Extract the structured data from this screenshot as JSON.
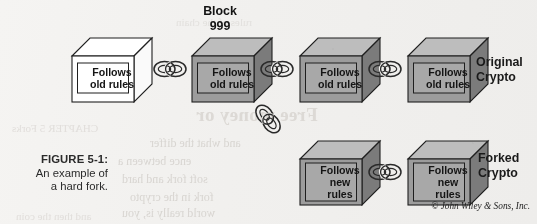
{
  "figure": {
    "caption_label": "FIGURE 5-1:",
    "caption_line1": "An example of",
    "caption_line2": "a hard fork.",
    "credit": "© John Wiley & Sons, Inc.",
    "background_color": "#f2f1ef"
  },
  "diagram": {
    "type": "blockchain-hard-fork",
    "block_marker": {
      "line1": "Block",
      "line2": "999"
    },
    "chain_top": [
      {
        "id": "block-1",
        "line1": "Follows",
        "line2": "old rules",
        "style": "white",
        "face_front": "#ffffff",
        "face_top": "#ffffff",
        "face_side": "#ffffff"
      },
      {
        "id": "block-2",
        "line1": "Follows",
        "line2": "old rules",
        "style": "gray",
        "face_front": "#9c9c9c",
        "face_top": "#bdbdbd",
        "face_side": "#7b7b7b"
      },
      {
        "id": "block-3",
        "line1": "Follows",
        "line2": "old rules",
        "style": "gray",
        "face_front": "#9c9c9c",
        "face_top": "#bdbdbd",
        "face_side": "#7b7b7b"
      },
      {
        "id": "block-4",
        "line1": "Follows",
        "line2": "old rules",
        "style": "gray",
        "face_front": "#9c9c9c",
        "face_top": "#bdbdbd",
        "face_side": "#7b7b7b"
      }
    ],
    "chain_fork": [
      {
        "id": "block-5",
        "line1": "Follows",
        "line2": "new",
        "line3": "rules",
        "style": "gray",
        "face_front": "#9c9c9c",
        "face_top": "#bdbdbd",
        "face_side": "#7b7b7b"
      },
      {
        "id": "block-6",
        "line1": "Follows",
        "line2": "new",
        "line3": "rules",
        "style": "gray",
        "face_front": "#9c9c9c",
        "face_top": "#bdbdbd",
        "face_side": "#7b7b7b"
      }
    ],
    "branch_labels": {
      "original_line1": "Original",
      "original_line2": "Crypto",
      "forked_line1": "Forked",
      "forked_line2": "Crypto"
    },
    "links": [
      {
        "id": "link-1-2",
        "orientation": "horizontal"
      },
      {
        "id": "link-2-3",
        "orientation": "horizontal"
      },
      {
        "id": "link-3-4",
        "orientation": "horizontal"
      },
      {
        "id": "link-fork",
        "orientation": "diagonal"
      },
      {
        "id": "link-5-6",
        "orientation": "horizontal"
      }
    ]
  },
  "bleed_through": {
    "heading": "Free money or",
    "l1": "and what the differ",
    "l2": "ence between a",
    "l3": "soft fork and hard",
    "l4": "fork in the crypto",
    "l5": "world really is, you",
    "t1": "rules of the chain",
    "s1": "CHAPTER 5 Forks",
    "s2": "and then the coin"
  }
}
